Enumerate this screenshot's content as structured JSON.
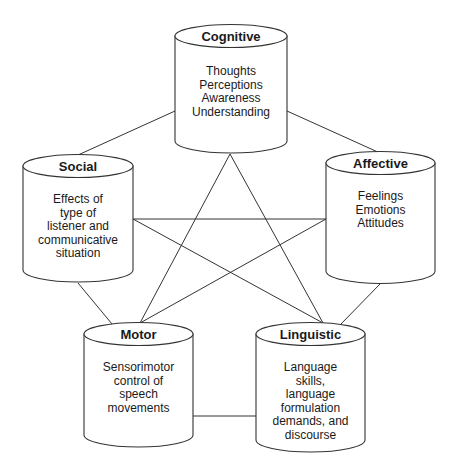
{
  "diagram": {
    "stroke_color": "#333333",
    "background": "#ffffff",
    "nodes": {
      "cognitive": {
        "title": "Cognitive",
        "lines": [
          "Thoughts",
          "Perceptions",
          "Awareness",
          "Understanding"
        ]
      },
      "social": {
        "title": "Social",
        "lines": [
          "Effects of",
          "type of",
          "listener and",
          "communicative",
          "situation"
        ]
      },
      "affective": {
        "title": "Affective",
        "lines": [
          "Feelings",
          "Emotions",
          "Attitudes"
        ]
      },
      "motor": {
        "title": "Motor",
        "lines": [
          "Sensorimotor",
          "control of",
          "speech",
          "movements"
        ]
      },
      "linguistic": {
        "title": "Linguistic",
        "lines": [
          "Language",
          "skills,",
          "language",
          "formulation",
          "demands, and",
          "discourse"
        ]
      }
    },
    "edges": [
      [
        "cognitive",
        "social"
      ],
      [
        "cognitive",
        "affective"
      ],
      [
        "social",
        "motor"
      ],
      [
        "affective",
        "linguistic"
      ],
      [
        "motor",
        "linguistic"
      ],
      [
        "cognitive",
        "motor"
      ],
      [
        "cognitive",
        "linguistic"
      ],
      [
        "social",
        "affective"
      ],
      [
        "social",
        "linguistic"
      ],
      [
        "affective",
        "motor"
      ]
    ]
  }
}
